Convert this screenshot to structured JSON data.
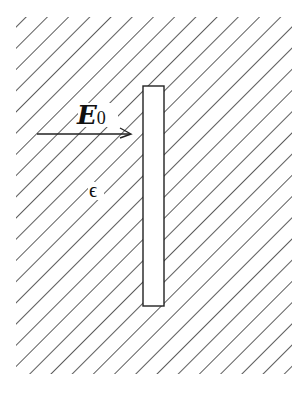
{
  "diagram": {
    "type": "physics-schematic",
    "colors": {
      "background": "#ffffff",
      "hatch": "#333333",
      "outline": "#222222",
      "text": "#111111"
    },
    "medium": {
      "hatched_region": {
        "x": 16,
        "y": 17,
        "width": 276,
        "height": 357
      },
      "hatch_spacing": 15,
      "hatch_angle_deg": 45
    },
    "slab": {
      "x": 143,
      "y": 86,
      "width": 21,
      "height": 220
    },
    "field_arrow": {
      "x1": 37,
      "y1": 134,
      "x2": 130,
      "y2": 134
    },
    "labels": {
      "field_main": "E",
      "field_sub": "0",
      "permittivity": "ϵ"
    }
  }
}
